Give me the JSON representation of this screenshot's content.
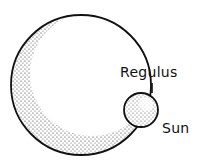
{
  "diagram": {
    "labels": {
      "regulus": "Regulus",
      "sun": "Sun"
    },
    "objects": [
      {
        "name": "Regulus",
        "shape": "circle",
        "cx": 81,
        "cy": 85,
        "r": 70,
        "shading": "stippled crescent, lower-left"
      },
      {
        "name": "Sun",
        "shape": "circle",
        "cx": 141,
        "cy": 110,
        "r": 17,
        "shading": "stippled"
      }
    ],
    "colors": {
      "stroke": "#111111",
      "stipple": "#222222",
      "background": "#ffffff"
    }
  }
}
